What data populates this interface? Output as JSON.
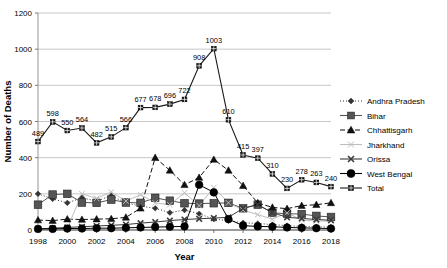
{
  "chart_data": {
    "type": "line",
    "title": "",
    "xlabel": "Year",
    "ylabel": "Number of Deaths",
    "xlim": [
      1998,
      2018
    ],
    "ylim": [
      0,
      1200
    ],
    "ytick_labels": [
      "0",
      "200",
      "400",
      "600",
      "800",
      "1000",
      "1200"
    ],
    "yticks": [
      0,
      200,
      400,
      600,
      800,
      1000,
      1200
    ],
    "xtick_labels": [
      "1998",
      "2000",
      "2002",
      "2004",
      "2006",
      "2008",
      "2010",
      "2012",
      "2014",
      "2016",
      "2018"
    ],
    "xticks": [
      1998,
      2000,
      2002,
      2004,
      2006,
      2008,
      2010,
      2012,
      2014,
      2016,
      2018
    ],
    "grid": "horizontal",
    "legend_position": "right",
    "x": [
      1998,
      1999,
      2000,
      2001,
      2002,
      2003,
      2004,
      2005,
      2006,
      2007,
      2008,
      2009,
      2010,
      2011,
      2012,
      2013,
      2014,
      2015,
      2016,
      2017,
      2018
    ],
    "series": [
      {
        "name": "Andhra Pradesh",
        "marker": "diamond",
        "line": "dotted",
        "color": "#333333",
        "values": [
          200,
          172,
          150,
          178,
          160,
          190,
          150,
          132,
          120,
          96,
          110,
          90,
          60,
          52,
          40,
          36,
          30,
          24,
          20,
          18,
          16
        ]
      },
      {
        "name": "Bihar",
        "marker": "square",
        "line": "solid",
        "color": "#555555",
        "values": [
          140,
          196,
          200,
          152,
          150,
          168,
          152,
          150,
          178,
          162,
          148,
          146,
          148,
          150,
          120,
          140,
          95,
          90,
          88,
          78,
          72
        ]
      },
      {
        "name": "Chhattisgarh",
        "marker": "triangle",
        "line": "dashed",
        "color": "#111111",
        "values": [
          55,
          52,
          60,
          58,
          60,
          62,
          70,
          120,
          400,
          330,
          250,
          290,
          390,
          330,
          245,
          150,
          125,
          118,
          135,
          140,
          150
        ]
      },
      {
        "name": "Jharkhand",
        "marker": "x",
        "line": "solid",
        "color": "#bdbdbd",
        "values": [
          4,
          6,
          10,
          200,
          175,
          210,
          160,
          195,
          150,
          140,
          205,
          135,
          235,
          150,
          110,
          85,
          60,
          95,
          55,
          50,
          48
        ]
      },
      {
        "name": "Orissa",
        "marker": "x-bold",
        "line": "solid",
        "color": "#3a3a3a",
        "values": [
          6,
          10,
          14,
          18,
          22,
          26,
          30,
          38,
          44,
          52,
          58,
          62,
          66,
          70,
          120,
          140,
          96,
          70,
          64,
          58,
          54
        ]
      },
      {
        "name": "West Bengal",
        "marker": "circle",
        "line": "solid",
        "color": "#000000",
        "values": [
          6,
          6,
          8,
          8,
          10,
          10,
          12,
          14,
          16,
          18,
          20,
          250,
          208,
          60,
          24,
          20,
          18,
          14,
          12,
          10,
          8
        ]
      },
      {
        "name": "Total",
        "marker": "grid-square",
        "line": "solid",
        "color": "#1a1a1a",
        "values": [
          489,
          598,
          550,
          564,
          482,
          515,
          566,
          677,
          678,
          696,
          722,
          908,
          1003,
          610,
          415,
          397,
          310,
          230,
          278,
          263,
          240
        ],
        "data_labels": [
          "489",
          "598",
          "550",
          "564",
          "482",
          "515",
          "566",
          "677",
          "678",
          "696",
          "722",
          "908",
          "1003",
          "610",
          "415",
          "397",
          "310",
          "230",
          "278",
          "263",
          "240"
        ]
      }
    ]
  },
  "legend": {
    "items": [
      {
        "label": "Andhra Pradesh"
      },
      {
        "label": "Bihar"
      },
      {
        "label": "Chhattisgarh"
      },
      {
        "label": "Jharkhand"
      },
      {
        "label": "Orissa"
      },
      {
        "label": "West Bengal"
      },
      {
        "label": "Total"
      }
    ]
  }
}
